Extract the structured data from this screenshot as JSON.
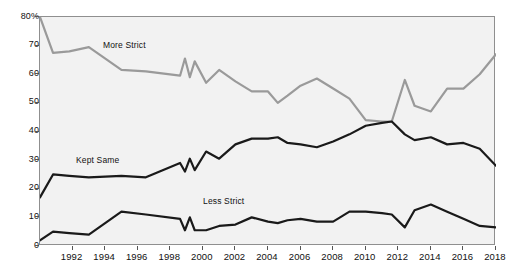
{
  "chart_data": {
    "type": "line",
    "title": "",
    "subtitle": "",
    "xlabel": "",
    "ylabel": "",
    "xlim": [
      1990,
      2018
    ],
    "ylim": [
      0,
      80
    ],
    "grid": false,
    "legend_position": "inline-annotations",
    "y_ticks": [
      0,
      10,
      20,
      30,
      40,
      50,
      60,
      70,
      80
    ],
    "y_tick_labels": [
      "0",
      "10",
      "20",
      "30",
      "40",
      "50",
      "60",
      "70",
      "80%"
    ],
    "x_ticks": [
      1992,
      1994,
      1996,
      1998,
      2000,
      2002,
      2004,
      2006,
      2008,
      2010,
      2012,
      2014,
      2016,
      2018
    ],
    "x_tick_labels": [
      "1992",
      "1994",
      "1996",
      "1998",
      "2000",
      "2002",
      "2004",
      "2006",
      "2008",
      "2010",
      "2012",
      "2014",
      "2016",
      "2018"
    ],
    "colors": {
      "more_strict": "#9a9a9a",
      "kept_same": "#1a1a1a",
      "less_strict": "#1a1a1a",
      "plot_background": "#f2f2f2",
      "frame": "#8f8f8f",
      "text": "#111111"
    },
    "series": [
      {
        "name": "More Strict",
        "color": "#9a9a9a",
        "x": [
          1990.0,
          1990.8,
          1991.8,
          1993.0,
          1995.0,
          1996.5,
          1998.6,
          1998.9,
          1999.2,
          1999.5,
          2000.2,
          2001.0,
          2002.0,
          2003.0,
          2004.0,
          2004.6,
          2005.2,
          2006.0,
          2007.0,
          2008.0,
          2009.0,
          2010.0,
          2011.0,
          2011.6,
          2012.4,
          2013.0,
          2014.0,
          2015.0,
          2016.0,
          2017.0,
          2018.0
        ],
        "y": [
          80.0,
          67.5,
          68.0,
          69.5,
          61.5,
          61.0,
          59.5,
          65.5,
          59.0,
          64.5,
          57.0,
          61.5,
          57.5,
          54.0,
          54.0,
          50.0,
          52.5,
          56.0,
          58.5,
          55.0,
          51.5,
          44.0,
          43.5,
          43.5,
          58.0,
          49.0,
          47.0,
          55.0,
          55.0,
          60.0,
          67.0
        ]
      },
      {
        "name": "Kept Same",
        "color": "#1a1a1a",
        "x": [
          1990.0,
          1990.8,
          1991.8,
          1993.0,
          1995.0,
          1996.5,
          1998.6,
          1998.9,
          1999.2,
          1999.5,
          2000.2,
          2001.0,
          2002.0,
          2003.0,
          2004.0,
          2004.6,
          2005.2,
          2006.0,
          2007.0,
          2008.0,
          2009.0,
          2010.0,
          2011.0,
          2011.6,
          2012.4,
          2013.0,
          2014.0,
          2015.0,
          2016.0,
          2017.0,
          2018.0
        ],
        "y": [
          17.0,
          25.0,
          24.5,
          24.0,
          24.5,
          24.0,
          29.0,
          26.0,
          30.5,
          26.5,
          33.0,
          30.5,
          35.5,
          37.5,
          37.5,
          38.0,
          36.0,
          35.5,
          34.5,
          36.5,
          39.0,
          42.0,
          43.0,
          43.5,
          39.0,
          37.0,
          38.0,
          35.5,
          36.0,
          34.0,
          28.0
        ]
      },
      {
        "name": "Less Strict",
        "color": "#1a1a1a",
        "x": [
          1990.0,
          1990.8,
          1991.8,
          1993.0,
          1995.0,
          1996.5,
          1998.6,
          1998.9,
          1999.2,
          1999.5,
          2000.2,
          2001.0,
          2002.0,
          2003.0,
          2004.0,
          2004.6,
          2005.2,
          2006.0,
          2007.0,
          2008.0,
          2009.0,
          2010.0,
          2011.0,
          2011.6,
          2012.4,
          2013.0,
          2014.0,
          2015.0,
          2016.0,
          2017.0,
          2018.0
        ],
        "y": [
          2.0,
          5.0,
          4.5,
          4.0,
          12.0,
          11.0,
          9.5,
          5.5,
          10.0,
          5.5,
          5.5,
          7.0,
          7.5,
          10.0,
          8.5,
          8.0,
          9.0,
          9.5,
          8.5,
          8.5,
          12.0,
          12.0,
          11.5,
          11.0,
          6.5,
          12.5,
          14.5,
          12.0,
          9.5,
          7.0,
          6.5
        ]
      }
    ],
    "annotations": [
      {
        "text": "More Strict",
        "x_px": 103,
        "y_px": 40
      },
      {
        "text": "Kept Same",
        "x_px": 76,
        "y_px": 155
      },
      {
        "text": "Less Strict",
        "x_px": 203,
        "y_px": 196
      }
    ]
  }
}
